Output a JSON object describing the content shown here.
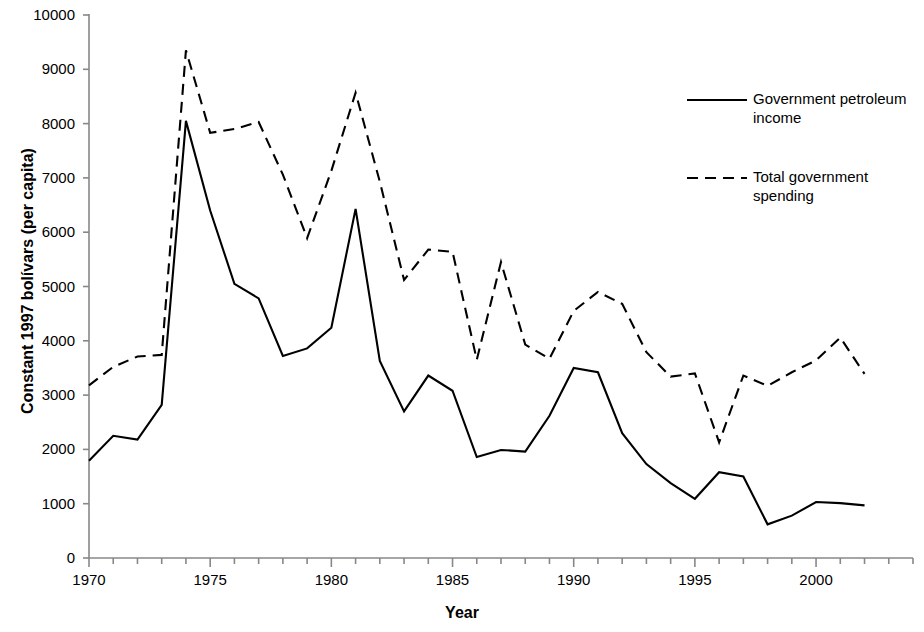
{
  "chart_data": {
    "type": "line",
    "title": "",
    "xlabel": "Year",
    "ylabel": "Constant 1997 bolívars (per capita)",
    "xlim": [
      1970,
      2004
    ],
    "ylim": [
      0,
      10000
    ],
    "grid": false,
    "legend_position": "top-right",
    "x_ticks_major": [
      1970,
      1975,
      1980,
      1985,
      1990,
      1995,
      2000
    ],
    "x_ticks_minor_step": 1,
    "y_ticks": [
      0,
      1000,
      2000,
      3000,
      4000,
      5000,
      6000,
      7000,
      8000,
      9000,
      10000
    ],
    "x": [
      1970,
      1971,
      1972,
      1973,
      1974,
      1975,
      1976,
      1977,
      1978,
      1979,
      1980,
      1981,
      1982,
      1983,
      1984,
      1985,
      1986,
      1987,
      1988,
      1989,
      1990,
      1991,
      1992,
      1993,
      1994,
      1995,
      1996,
      1997,
      1998,
      1999,
      2000,
      2001,
      2002
    ],
    "series": [
      {
        "name": "Government petroleum income",
        "style": "solid",
        "color": "#000000",
        "values": [
          1790,
          2250,
          2180,
          2820,
          8050,
          6400,
          5050,
          4780,
          3720,
          3860,
          4240,
          6430,
          3630,
          2700,
          3360,
          3080,
          1860,
          1990,
          1960,
          2620,
          3500,
          3420,
          2300,
          1730,
          1380,
          1090,
          1580,
          1500,
          620,
          780,
          1030,
          1010,
          970
        ]
      },
      {
        "name": "Total government spending",
        "style": "dashed",
        "color": "#000000",
        "values": [
          3180,
          3520,
          3710,
          3740,
          9350,
          7830,
          7900,
          8030,
          7060,
          5890,
          7130,
          8570,
          6930,
          5120,
          5680,
          5640,
          3650,
          5450,
          3930,
          3670,
          4550,
          4900,
          4680,
          3790,
          3340,
          3400,
          2130,
          3360,
          3170,
          3420,
          3640,
          4060,
          3390
        ]
      }
    ]
  },
  "legend": {
    "items": [
      {
        "label_line1": "Government petroleum",
        "label_line2": "income",
        "style": "solid"
      },
      {
        "label_line1": "Total government",
        "label_line2": "spending",
        "style": "dashed"
      }
    ]
  },
  "axis": {
    "y_title": "Constant 1997 bolívars (per capita)",
    "x_title": "Year"
  }
}
